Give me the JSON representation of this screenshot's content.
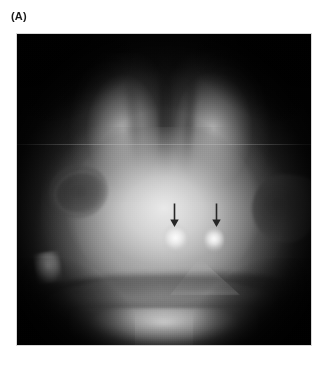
{
  "figure": {
    "panel_label": "(A)",
    "modality": "cranial-ultrasound",
    "view": "coronal",
    "colors": {
      "page_background": "#ffffff",
      "label_text": "#1a1a1a",
      "frame_border": "#d8d8d8",
      "scan_background": "#121212",
      "annotation_arrow": "#262626",
      "echogenic_focus": "#ffffff"
    }
  },
  "image_frame": {
    "x": 17,
    "y": 34,
    "width": 294,
    "height": 311
  },
  "annotations": [
    {
      "name": "arrow-left",
      "glyph": "downward-arrow",
      "x": 169,
      "y": 203,
      "points_to": "left echogenic focus"
    },
    {
      "name": "arrow-right",
      "glyph": "downward-arrow",
      "x": 211,
      "y": 203,
      "points_to": "right echogenic focus"
    }
  ],
  "features": [
    {
      "name": "interhemispheric-fissure",
      "appearance": "dark vertical midline, upper half"
    },
    {
      "name": "left-sylvian-fissure",
      "appearance": "dark oval, mid-left"
    },
    {
      "name": "right-sylvian-fissure",
      "appearance": "dark wedge, mid-right"
    },
    {
      "name": "left-echogenic-focus",
      "appearance": "bright focus below left arrow"
    },
    {
      "name": "right-echogenic-focus",
      "appearance": "bright focus below right arrow"
    },
    {
      "name": "lower-left-bright-focus",
      "appearance": "small bright triangle, lower left"
    },
    {
      "name": "tentorium-peak",
      "appearance": "bright triangular peak, lower mid"
    },
    {
      "name": "cerebellum",
      "appearance": "lens-shaped band, lower field"
    },
    {
      "name": "scan-line-artifact",
      "appearance": "faint horizontal line across mid field"
    }
  ]
}
